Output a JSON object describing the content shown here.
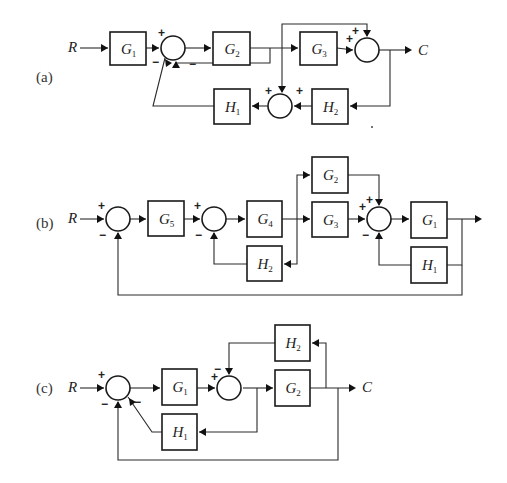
{
  "header": {
    "partial_caption": "... block diagrams ..."
  },
  "diagrams": [
    {
      "id": "a",
      "label": "(a)",
      "label_pos": [
        36,
        82
      ],
      "input": {
        "text": "R",
        "x": 68,
        "y": 52
      },
      "output": {
        "text": "C",
        "x": 418,
        "y": 55
      },
      "blocks": [
        {
          "id": "G1",
          "name": "G",
          "sub": "1",
          "x": 110,
          "y": 32,
          "w": 36,
          "h": 33
        },
        {
          "id": "G2",
          "name": "G",
          "sub": "2",
          "x": 213,
          "y": 32,
          "w": 37,
          "h": 33
        },
        {
          "id": "G3",
          "name": "G",
          "sub": "3",
          "x": 300,
          "y": 32,
          "w": 37,
          "h": 33
        },
        {
          "id": "H1",
          "name": "H",
          "sub": "1",
          "x": 214,
          "y": 89,
          "w": 36,
          "h": 35
        },
        {
          "id": "H2",
          "name": "H",
          "sub": "2",
          "x": 312,
          "y": 89,
          "w": 36,
          "h": 35
        }
      ],
      "sums": [
        {
          "id": "S1",
          "cx": 173,
          "cy": 48,
          "r": 12
        },
        {
          "id": "S2",
          "cx": 367,
          "cy": 50,
          "r": 12
        },
        {
          "id": "S3",
          "cx": 280,
          "cy": 106,
          "r": 12
        }
      ],
      "signs": [
        {
          "t": "+",
          "x": 158,
          "y": 37
        },
        {
          "t": "−",
          "x": 152,
          "y": 66
        },
        {
          "t": "−",
          "x": 189,
          "y": 68
        },
        {
          "t": "+",
          "x": 346,
          "y": 43
        },
        {
          "t": "+",
          "x": 352,
          "y": 35
        },
        {
          "t": "+",
          "x": 265,
          "y": 95
        },
        {
          "t": "+",
          "x": 296,
          "y": 95
        }
      ],
      "wires": [
        "M80 48 L108 48",
        "M146 48 L159 48",
        "M185 48 L211 48",
        "M250 48 L298 48",
        "M337 48 L353 50",
        "M379 50 L410 50",
        "M270 48 L270 63 L176 63 L176 62",
        "M282 48 L282 24 L367 24 L367 36",
        "M282 48 L282 92",
        "M390 50 L390 106 L350 106",
        "M312 106 L294 106",
        "M268 106 L252 106",
        "M214 106 L153 106 L165 58"
      ],
      "arrows": [
        [
          108,
          48,
          "r"
        ],
        [
          159,
          48,
          "r"
        ],
        [
          211,
          48,
          "r"
        ],
        [
          298,
          48,
          "r"
        ],
        [
          353,
          50,
          "r"
        ],
        [
          412,
          50,
          "r"
        ],
        [
          176,
          61,
          "u"
        ],
        [
          367,
          37,
          "d"
        ],
        [
          282,
          93,
          "d"
        ],
        [
          350,
          106,
          "l"
        ],
        [
          294,
          106,
          "l"
        ],
        [
          252,
          106,
          "l"
        ],
        [
          165,
          59,
          "ul"
        ]
      ],
      "dots": [
        [
          372,
          127
        ]
      ]
    },
    {
      "id": "b",
      "label": "(b)",
      "label_pos": [
        36,
        228
      ],
      "input": {
        "text": "R",
        "x": 68,
        "y": 223
      },
      "output": {
        "text": "",
        "x": 0,
        "y": 0
      },
      "blocks": [
        {
          "id": "G5",
          "name": "G",
          "sub": "5",
          "x": 148,
          "y": 201,
          "w": 36,
          "h": 35
        },
        {
          "id": "G4",
          "name": "G",
          "sub": "4",
          "x": 247,
          "y": 201,
          "w": 35,
          "h": 36
        },
        {
          "id": "H2",
          "name": "H",
          "sub": "2",
          "x": 247,
          "y": 246,
          "w": 35,
          "h": 35
        },
        {
          "id": "G2",
          "name": "G",
          "sub": "2",
          "x": 312,
          "y": 157,
          "w": 36,
          "h": 36
        },
        {
          "id": "G3",
          "name": "G",
          "sub": "3",
          "x": 312,
          "y": 202,
          "w": 36,
          "h": 35
        },
        {
          "id": "G1",
          "name": "G",
          "sub": "1",
          "x": 411,
          "y": 202,
          "w": 36,
          "h": 36
        },
        {
          "id": "H1",
          "name": "H",
          "sub": "1",
          "x": 411,
          "y": 247,
          "w": 36,
          "h": 36
        }
      ],
      "sums": [
        {
          "id": "S1",
          "cx": 118,
          "cy": 219,
          "r": 12
        },
        {
          "id": "S2",
          "cx": 214,
          "cy": 219,
          "r": 12
        },
        {
          "id": "S3",
          "cx": 379,
          "cy": 219,
          "r": 12
        }
      ],
      "signs": [
        {
          "t": "+",
          "x": 98,
          "y": 210
        },
        {
          "t": "−",
          "x": 99,
          "y": 239
        },
        {
          "t": "+",
          "x": 194,
          "y": 210
        },
        {
          "t": "−",
          "x": 195,
          "y": 239
        },
        {
          "t": "+",
          "x": 359,
          "y": 211
        },
        {
          "t": "+",
          "x": 366,
          "y": 204
        },
        {
          "t": "−",
          "x": 362,
          "y": 239
        }
      ],
      "wires": [
        "M80 219 L104 219",
        "M130 219 L146 219",
        "M184 219 L200 219",
        "M226 219 L245 219",
        "M282 219 L310 219",
        "M297 219 L297 175 L310 175",
        "M297 219 L297 264 L284 264",
        "M247 264 L214 264 L214 233",
        "M348 219 L365 219",
        "M348 175 L379 175 L379 205",
        "M391 219 L409 219",
        "M447 219 L478 219",
        "M462 219 L462 265 L447 265",
        "M411 265 L379 265 L379 233",
        "M462 265 L462 295 L118 295 L118 233"
      ],
      "arrows": [
        [
          104,
          219,
          "r"
        ],
        [
          146,
          219,
          "r"
        ],
        [
          200,
          219,
          "r"
        ],
        [
          245,
          219,
          "r"
        ],
        [
          310,
          219,
          "r"
        ],
        [
          310,
          175,
          "r"
        ],
        [
          284,
          264,
          "l"
        ],
        [
          214,
          232,
          "u"
        ],
        [
          365,
          219,
          "r"
        ],
        [
          379,
          206,
          "d"
        ],
        [
          409,
          219,
          "r"
        ],
        [
          482,
          219,
          "r"
        ],
        [
          379,
          232,
          "u"
        ],
        [
          118,
          232,
          "u"
        ]
      ],
      "dots": []
    },
    {
      "id": "c",
      "label": "(c)",
      "label_pos": [
        36,
        393
      ],
      "input": {
        "text": "R",
        "x": 68,
        "y": 392
      },
      "output": {
        "text": "C",
        "x": 362,
        "y": 392
      },
      "blocks": [
        {
          "id": "G1",
          "name": "G",
          "sub": "1",
          "x": 162,
          "y": 369,
          "w": 35,
          "h": 36
        },
        {
          "id": "H1",
          "name": "H",
          "sub": "1",
          "x": 162,
          "y": 414,
          "w": 35,
          "h": 36
        },
        {
          "id": "H2",
          "name": "H",
          "sub": "2",
          "x": 275,
          "y": 325,
          "w": 35,
          "h": 36
        },
        {
          "id": "G2",
          "name": "G",
          "sub": "2",
          "x": 275,
          "y": 370,
          "w": 35,
          "h": 36
        }
      ],
      "sums": [
        {
          "id": "S1",
          "cx": 118,
          "cy": 388,
          "r": 12
        },
        {
          "id": "S2",
          "cx": 229,
          "cy": 388,
          "r": 12
        }
      ],
      "signs": [
        {
          "t": "+",
          "x": 98,
          "y": 379
        },
        {
          "t": "−",
          "x": 101,
          "y": 408
        },
        {
          "t": "−",
          "x": 134,
          "y": 406
        },
        {
          "t": "+",
          "x": 211,
          "y": 381
        },
        {
          "t": "−",
          "x": 214,
          "y": 373
        }
      ],
      "wires": [
        "M80 388 L104 388",
        "M130 388 L160 388",
        "M197 388 L215 388",
        "M243 388 L273 388",
        "M310 388 L352 388",
        "M257 388 L257 432 L199 432",
        "M162 432 L152 432 L128 397",
        "M326 388 L326 343 L312 343",
        "M275 343 L229 343 L229 374",
        "M338 388 L338 460 L118 460 L118 402"
      ],
      "arrows": [
        [
          104,
          388,
          "r"
        ],
        [
          160,
          388,
          "r"
        ],
        [
          215,
          388,
          "r"
        ],
        [
          273,
          388,
          "r"
        ],
        [
          356,
          388,
          "r"
        ],
        [
          199,
          432,
          "l"
        ],
        [
          129,
          398,
          "ul"
        ],
        [
          312,
          343,
          "l"
        ],
        [
          229,
          375,
          "d"
        ],
        [
          118,
          401,
          "u"
        ]
      ],
      "dots": []
    }
  ]
}
